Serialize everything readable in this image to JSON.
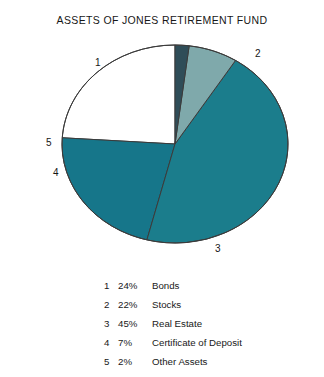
{
  "chart_data": {
    "type": "pie",
    "title": "ASSETS OF JONES RETIREMENT FUND",
    "xlabel": "",
    "ylabel": "",
    "grid": false,
    "legend_position": "bottom",
    "units": "percent",
    "total": 100,
    "categories": [
      "Bonds",
      "Stocks",
      "Real Estate",
      "Certificate of Deposit",
      "Other Assets"
    ],
    "values": [
      24,
      22,
      45,
      7,
      2
    ],
    "labels": [
      "1",
      "2",
      "3",
      "4",
      "5"
    ],
    "value_labels": [
      "24%",
      "22%",
      "45%",
      "7%",
      "2%"
    ],
    "colors": [
      "#ffffff",
      "#16768a",
      "#1b7d8c",
      "#7fa9ab",
      "#2f4d58"
    ],
    "start_angle_deg": 0,
    "direction": "counterclockwise",
    "slices": [
      {
        "index": "1",
        "percent": "24%",
        "value": 24,
        "name": "Bonds",
        "color": "#ffffff"
      },
      {
        "index": "2",
        "percent": "22%",
        "value": 22,
        "name": "Stocks",
        "color": "#16768a"
      },
      {
        "index": "3",
        "percent": "45%",
        "value": 45,
        "name": "Real Estate",
        "color": "#1b7d8c"
      },
      {
        "index": "4",
        "percent": "7%",
        "value": 7,
        "name": "Certificate of Deposit",
        "color": "#7fa9ab"
      },
      {
        "index": "5",
        "percent": "2%",
        "value": 2,
        "name": "Other Assets",
        "color": "#2f4d58"
      }
    ]
  },
  "figure": {
    "title": "ASSETS OF JONES RETIREMENT FUND",
    "background": "#ffffff",
    "outline_color": "#3b3b3b"
  },
  "pie_labels": [
    {
      "text": "1",
      "left": 45,
      "top": 20
    },
    {
      "text": "2",
      "left": 205,
      "top": 11
    },
    {
      "text": "3",
      "left": 165,
      "top": 206
    },
    {
      "text": "5",
      "left": -4,
      "top": 100
    },
    {
      "text": "4",
      "left": 3,
      "top": 130
    }
  ],
  "legend": {
    "rows": [
      {
        "index": "1",
        "percent": "24%",
        "name": "Bonds"
      },
      {
        "index": "2",
        "percent": "22%",
        "name": "Stocks"
      },
      {
        "index": "3",
        "percent": "45%",
        "name": "Real Estate"
      },
      {
        "index": "4",
        "percent": "7%",
        "name": "Certificate of Deposit"
      },
      {
        "index": "5",
        "percent": "2%",
        "name": "Other Assets"
      }
    ]
  }
}
